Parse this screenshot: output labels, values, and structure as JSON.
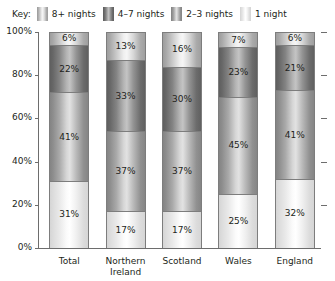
{
  "legend": {
    "key_label": "Key:",
    "items": [
      {
        "label": "8+ nights",
        "swatch": "swatch-8plus-icon",
        "color": "#9a9a9a"
      },
      {
        "label": "4–7 nights",
        "swatch": "swatch-4-7-icon",
        "color": "#5c5c5c"
      },
      {
        "label": "2–3 nights",
        "swatch": "swatch-2-3-icon",
        "color": "#818181"
      },
      {
        "label": "1 night",
        "swatch": "swatch-1-icon",
        "color": "#d3d3d3"
      }
    ]
  },
  "chart_data": {
    "type": "bar",
    "title": "",
    "xlabel": "",
    "ylabel": "",
    "ylim": [
      0,
      100
    ],
    "grid": false,
    "stacked": true,
    "stack_total": "100%",
    "legend_position": "top-left",
    "ytick_labels": [
      "100%",
      "80%",
      "60%",
      "40%",
      "20%",
      "0%"
    ],
    "ytick_values": [
      100,
      80,
      60,
      40,
      20,
      0
    ],
    "categories": [
      "Total",
      "Northern Ireland",
      "Scotland",
      "Wales",
      "England"
    ],
    "series": [
      {
        "name": "8+ nights",
        "values": [
          6,
          13,
          16,
          7,
          6
        ],
        "labels": [
          "6%",
          "13%",
          "16%",
          "7%",
          "6%"
        ]
      },
      {
        "name": "4–7 nights",
        "values": [
          22,
          33,
          30,
          23,
          21
        ],
        "labels": [
          "22%",
          "33%",
          "30%",
          "23%",
          "21%"
        ]
      },
      {
        "name": "2–3 nights",
        "values": [
          41,
          37,
          37,
          45,
          41
        ],
        "labels": [
          "41%",
          "37%",
          "37%",
          "45%",
          "41%"
        ]
      },
      {
        "name": "1 night",
        "values": [
          31,
          17,
          17,
          25,
          32
        ],
        "labels": [
          "31%",
          "17%",
          "17%",
          "25%",
          "32%"
        ]
      }
    ]
  }
}
